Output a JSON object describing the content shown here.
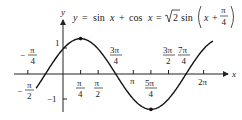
{
  "equation": {
    "lhs": "y",
    "eq1": "=",
    "term1": "sin",
    "var1": "x",
    "plus": "+",
    "term2": "cos",
    "var2": "x",
    "eq2": "=",
    "sqrt_coef": "2",
    "term3": "sin",
    "arg_var": "x",
    "arg_plus": "+",
    "arg_num": "π",
    "arg_den": "4"
  },
  "axes": {
    "x_label": "x",
    "y_label": "y"
  },
  "x_ticks": [
    {
      "num": "−",
      "label_num": "π",
      "label_den": "2",
      "value": "-π/2"
    },
    {
      "label_num": "π",
      "label_den": "4",
      "value": "π/4"
    },
    {
      "label_num": "π",
      "label_den": "2",
      "value": "π/2"
    },
    {
      "label": "π",
      "value": "π"
    },
    {
      "label_num": "5π",
      "label_den": "4",
      "value": "5π/4"
    },
    {
      "label_num": "3π",
      "label_den": "2",
      "value": "3π/2"
    },
    {
      "label": "2π",
      "value": "2π"
    }
  ],
  "point_labels": {
    "neg_pi_over_4": {
      "sign": "−",
      "num": "π",
      "den": "4"
    },
    "three_pi_over_4": {
      "num": "3π",
      "den": "4"
    },
    "seven_pi_over_4": {
      "num": "7π",
      "den": "4"
    }
  },
  "y_ticks": [
    {
      "label": "1",
      "value": 1
    },
    {
      "label": "−1",
      "value": -1
    }
  ],
  "chart_data": {
    "type": "line",
    "xlabel": "x",
    "ylabel": "y",
    "xlim": [
      -1.8,
      6.6
    ],
    "ylim": [
      -1.5,
      1.5
    ],
    "function": "sqrt(2)*sin(x + pi/4)",
    "key_points": [
      {
        "x": "-π/4",
        "y": 0
      },
      {
        "x": "0",
        "y": 1
      },
      {
        "x": "π/4",
        "y": 1.414,
        "marked": true
      },
      {
        "x": "3π/4",
        "y": 0
      },
      {
        "x": "5π/4",
        "y": -1.414,
        "marked": true
      },
      {
        "x": "7π/4",
        "y": 0
      }
    ],
    "x_tick_labels": [
      "-π/2",
      "π/4",
      "π/2",
      "π",
      "5π/4",
      "3π/2",
      "2π"
    ],
    "y_tick_labels": [
      "1",
      "-1"
    ],
    "grid": false
  }
}
